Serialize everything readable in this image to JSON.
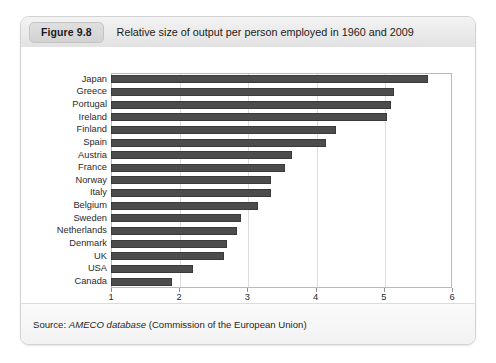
{
  "figure": {
    "badge": "Figure 9.8",
    "title": "Relative size of output per person employed in 1960 and 2009",
    "source_prefix": "Source:",
    "source_emphasis": "AMECO database",
    "source_suffix": "(Commission of the European Union)"
  },
  "colors": {
    "bar": "#4c4c4c",
    "bar_border": "#3a3a3a",
    "grid": "#dcdcdc",
    "frame": "#b9b9b9",
    "header_bg": "#eaeaea",
    "badge_bg": "#d6d6d6"
  },
  "chart_data": {
    "type": "bar",
    "orientation": "horizontal",
    "title": "Relative size of output per person employed in 1960 and 2009",
    "xlabel": "",
    "ylabel": "",
    "xlim": [
      1,
      6
    ],
    "xticks": [
      1,
      2,
      3,
      4,
      5,
      6
    ],
    "xtick_labels": [
      "1",
      "2",
      "3",
      "4",
      "5",
      "6"
    ],
    "grid": true,
    "legend": false,
    "categories": [
      "Japan",
      "Greece",
      "Portugal",
      "Ireland",
      "Finland",
      "Spain",
      "Austria",
      "France",
      "Norway",
      "Italy",
      "Belgium",
      "Sweden",
      "Netherlands",
      "Denmark",
      "UK",
      "USA",
      "Canada"
    ],
    "values": [
      5.65,
      5.15,
      5.1,
      5.05,
      4.3,
      4.15,
      3.65,
      3.55,
      3.35,
      3.35,
      3.15,
      2.9,
      2.85,
      2.7,
      2.65,
      2.2,
      1.9
    ]
  }
}
